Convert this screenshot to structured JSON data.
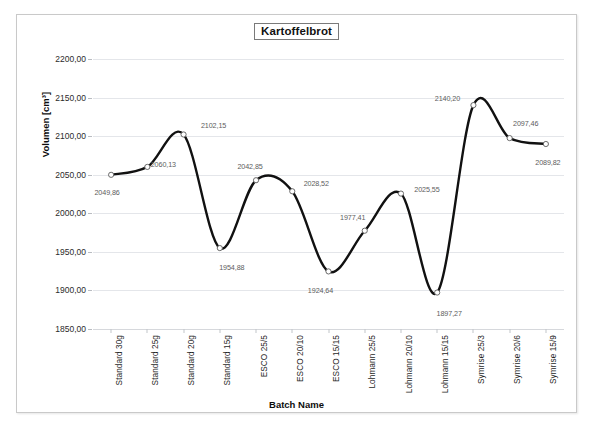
{
  "chart_data": {
    "type": "line",
    "title": "Kartoffelbrot",
    "xlabel": "Batch Name",
    "ylabel": "Volumen [cm³]",
    "categories": [
      "Standard 30g",
      "Standard 25g",
      "Standard 20g",
      "Standard 15g",
      "ESCO 25/5",
      "ESCO 20/10",
      "ESCO 15/15",
      "Lohmann 25/5",
      "Lohmann 20/10",
      "Lohmann 15/15",
      "Symrise 25/3",
      "Symrise 20/6",
      "Symrise 15/9"
    ],
    "values": [
      2049.86,
      2060.13,
      2102.15,
      1954.88,
      2042.85,
      2028.52,
      1924.64,
      1977.41,
      2025.55,
      1897.27,
      2140.2,
      2097.46,
      2089.82
    ],
    "point_labels": [
      "2049,86",
      "2060,13",
      "2102,15",
      "1954,88",
      "2042,85",
      "2028,52",
      "1924,64",
      "1977,41",
      "2025,55",
      "1897,27",
      "2140,20",
      "2097,46",
      "2089,82"
    ],
    "ylim": [
      1850,
      2200
    ],
    "ytick_values": [
      2200,
      2150,
      2100,
      2050,
      2000,
      1950,
      1900,
      1850
    ],
    "ytick_labels": [
      "2200,00",
      "2150,00",
      "2100,00",
      "2050,00",
      "2000,00",
      "1950,00",
      "1900,00",
      "1850,00"
    ],
    "grid": true,
    "legend": "none",
    "smoothing": "spline",
    "line_color": "#111111",
    "marker_fill": "#ffffff",
    "marker_stroke": "#5a5a5a",
    "gridline_color": "#e4e6ea",
    "label_color": "#5d5d5d"
  },
  "scan": {
    "artifact_text": ""
  }
}
